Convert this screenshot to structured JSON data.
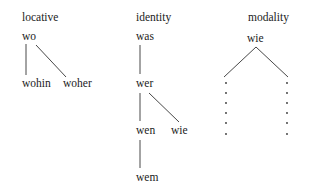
{
  "columns": {
    "locative": {
      "heading": "locative",
      "nodes": {
        "root": "wo",
        "left": "wohin",
        "right": "woher"
      }
    },
    "identity": {
      "heading": "identity",
      "nodes": {
        "top": "was",
        "mid": "wer",
        "left": "wen",
        "right": "wie",
        "bottom": "wem"
      }
    },
    "modality": {
      "heading": "modality",
      "nodes": {
        "root": "wie"
      },
      "dotted_branches": 2,
      "dots_per_branch": 6
    }
  }
}
